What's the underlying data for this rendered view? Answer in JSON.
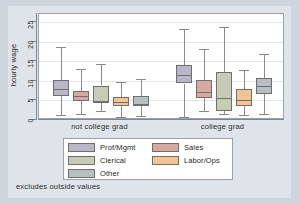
{
  "figure": {
    "background_color": "#ced5dd",
    "panel_color": "#ffffff",
    "footnote": "excludes outside values"
  },
  "chart_data": {
    "type": "box",
    "title": "",
    "xlabel": "",
    "ylabel": "hourly wage",
    "ylim": [
      0,
      27
    ],
    "yticks": [
      0,
      5,
      10,
      15,
      20,
      25
    ],
    "ytick_labels": [
      "0",
      "5",
      "10",
      "15",
      "20",
      "25"
    ],
    "grid": true,
    "legend_position": "below-axes",
    "groups": [
      "not college grad",
      "college grad"
    ],
    "series": [
      {
        "name": "Prof/Mgmt",
        "color": "#b9b6ca",
        "edge_color": "#6f6f6f",
        "boxes": [
          {
            "group": "not college grad",
            "whisker_low": 1.4,
            "q1": 6.1,
            "median": 8.0,
            "q3": 10.1,
            "whisker_high": 18.6
          },
          {
            "group": "college grad",
            "whisker_low": 0.8,
            "q1": 9.3,
            "median": 11.4,
            "q3": 13.9,
            "whisker_high": 23.2
          }
        ]
      },
      {
        "name": "Sales",
        "color": "#d8a9a0",
        "edge_color": "#6f6f6f",
        "boxes": [
          {
            "group": "not college grad",
            "whisker_low": 1.6,
            "q1": 4.9,
            "median": 6.1,
            "q3": 7.3,
            "whisker_high": 13.1
          },
          {
            "group": "college grad",
            "whisker_low": 2.4,
            "q1": 5.6,
            "median": 7.2,
            "q3": 10.3,
            "whisker_high": 18.2
          }
        ]
      },
      {
        "name": "Clerical",
        "color": "#c8cbb4",
        "edge_color": "#6f6f6f",
        "boxes": [
          {
            "group": "not college grad",
            "whisker_low": 2.3,
            "q1": 4.3,
            "median": 4.9,
            "q3": 8.8,
            "whisker_high": 14.2
          },
          {
            "group": "college grad",
            "whisker_low": 1.5,
            "q1": 2.4,
            "median": 5.6,
            "q3": 12.2,
            "whisker_high": 23.7
          }
        ]
      },
      {
        "name": "Labor/Ops",
        "color": "#f4c393",
        "edge_color": "#6f6f6f",
        "boxes": [
          {
            "group": "not college grad",
            "whisker_low": 0.8,
            "q1": 3.5,
            "median": 4.6,
            "q3": 5.9,
            "whisker_high": 9.8
          },
          {
            "group": "college grad",
            "whisker_low": 1.2,
            "q1": 3.7,
            "median": 5.0,
            "q3": 7.9,
            "whisker_high": 12.8
          }
        ]
      },
      {
        "name": "Other",
        "color": "#b8bfc2",
        "edge_color": "#6f6f6f",
        "boxes": [
          {
            "group": "not college grad",
            "whisker_low": 1.0,
            "q1": 3.5,
            "median": 4.1,
            "q3": 6.2,
            "whisker_high": 10.5
          },
          {
            "group": "college grad",
            "whisker_low": 1.6,
            "q1": 6.7,
            "median": 8.6,
            "q3": 10.7,
            "whisker_high": 16.8
          }
        ]
      }
    ]
  },
  "legend": {
    "left_column": [
      {
        "label": "Prof/Mgmt",
        "color": "#b9b6ca"
      },
      {
        "label": "Clerical",
        "color": "#c8cbb4"
      },
      {
        "label": "Other",
        "color": "#b8bfc2"
      }
    ],
    "right_column": [
      {
        "label": "Sales",
        "color": "#d8a9a0"
      },
      {
        "label": "Labor/Ops",
        "color": "#f4c393"
      }
    ]
  }
}
